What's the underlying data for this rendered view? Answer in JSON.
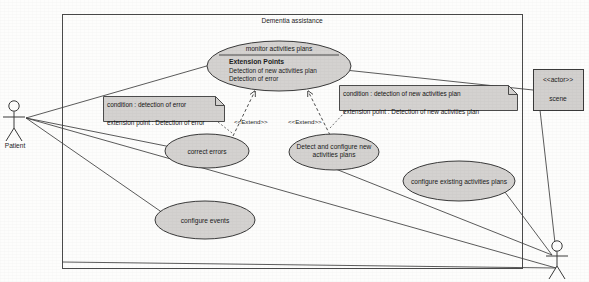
{
  "diagram": {
    "kind": "uml-use-case-diagram",
    "system_boundary": {
      "label": "Dementia assistance"
    },
    "colors": {
      "use_case_fill": "#d4d2d0",
      "note_fill": "#d4d2d0",
      "actor_box_fill": "#d2d0ce",
      "stroke": "#3a3a3a",
      "page_background": "#fdfdfc"
    },
    "actors": [
      {
        "id": "patient",
        "label": "Patient",
        "shape": "stick-figure",
        "position": "left"
      },
      {
        "id": "caregiver",
        "label": "",
        "shape": "stick-figure",
        "position": "bottom-right"
      },
      {
        "id": "scene",
        "stereotype": "<<actor>>",
        "label": "scene",
        "shape": "class-box",
        "position": "right"
      }
    ],
    "use_cases": [
      {
        "id": "monitor-activities-plans",
        "name": "monitor activities plans",
        "has_compartment": true,
        "extension_points_title": "Extension Points",
        "extension_points": [
          "Detection of new activities plan",
          "Detection of error"
        ]
      },
      {
        "id": "correct-errors",
        "name": "correct errors"
      },
      {
        "id": "detect-configure-new-activities-plans",
        "name": "Detect and configure new\nactivities plans"
      },
      {
        "id": "configure-existing-activities-plans",
        "name": "configure existing activities plans"
      },
      {
        "id": "configure-events",
        "name": "configure events"
      }
    ],
    "notes": [
      {
        "id": "note-error",
        "lines": [
          "condition : detection of error",
          "extension point : Detection of error"
        ]
      },
      {
        "id": "note-new-plan",
        "lines": [
          "condition : detection of new activities plan",
          "extension point : Detection of new activities plan"
        ]
      }
    ],
    "relationships": [
      {
        "type": "extend",
        "label": "<<Extend>>",
        "from": "correct-errors",
        "to": "monitor-activities-plans"
      },
      {
        "type": "extend",
        "label": "<<Extend>>",
        "from": "detect-configure-new-activities-plans",
        "to": "monitor-activities-plans"
      },
      {
        "type": "association",
        "from": "patient",
        "to": "monitor-activities-plans"
      },
      {
        "type": "association",
        "from": "patient",
        "to": "correct-errors"
      },
      {
        "type": "association",
        "from": "patient",
        "to": "configure-events"
      },
      {
        "type": "association",
        "from": "patient",
        "to": "caregiver"
      },
      {
        "type": "association",
        "from": "scene",
        "to": "monitor-activities-plans"
      },
      {
        "type": "association",
        "from": "scene",
        "to": "caregiver"
      },
      {
        "type": "association",
        "from": "caregiver",
        "to": "detect-configure-new-activities-plans"
      },
      {
        "type": "association",
        "from": "caregiver",
        "to": "configure-existing-activities-plans"
      }
    ]
  }
}
